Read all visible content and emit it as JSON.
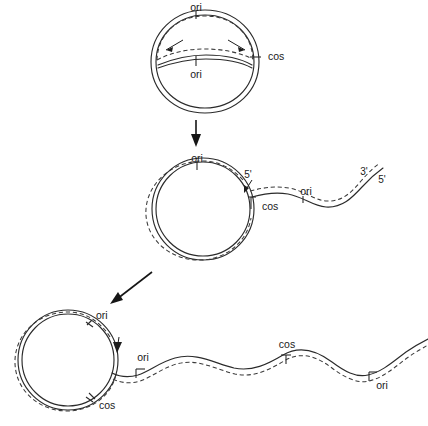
{
  "figure": {
    "background_color": "#ffffff",
    "line_color": "#2b2b2b",
    "dashed_color": "#3a3a3a"
  },
  "stages": [
    {
      "id": "stage-1",
      "name": "theta-intermediate-circle",
      "description": "Circular duplex with internal replication bubble and inward arrows",
      "labels": [
        {
          "id": "s1-ori-top",
          "text": "ori",
          "x": 196,
          "y": 8
        },
        {
          "id": "s1-ori-inner",
          "text": "ori",
          "x": 196,
          "y": 75
        },
        {
          "id": "s1-cos",
          "text": "cos",
          "x": 270,
          "y": 57
        }
      ]
    },
    {
      "id": "stage-2",
      "name": "rolling-circle-short-tail",
      "description": "Circle with displaced single tail bearing one ori and terminal 3'/5' ends",
      "labels": [
        {
          "id": "s2-ori-top",
          "text": "ori",
          "x": 197,
          "y": 159
        },
        {
          "id": "s2-five-prime",
          "text": "5'",
          "x": 248,
          "y": 175
        },
        {
          "id": "s2-cos",
          "text": "cos",
          "x": 270,
          "y": 207
        },
        {
          "id": "s2-ori-tail",
          "text": "ori",
          "x": 306,
          "y": 192
        },
        {
          "id": "s2-three-prime",
          "text": "3'",
          "x": 364,
          "y": 172
        },
        {
          "id": "s2-five-prime-end",
          "text": "5'",
          "x": 382,
          "y": 180
        }
      ]
    },
    {
      "id": "stage-3",
      "name": "rolling-circle-long-concatemer",
      "description": "Circle with long concatemeric tail carrying repeated cos and ori sites",
      "labels": [
        {
          "id": "s3-ori-circle",
          "text": "ori",
          "x": 97,
          "y": 316
        },
        {
          "id": "s3-cos-circle",
          "text": "cos",
          "x": 106,
          "y": 406
        },
        {
          "id": "s3-ori-junction",
          "text": "ori",
          "x": 143,
          "y": 358
        },
        {
          "id": "s3-cos-tail",
          "text": "cos",
          "x": 287,
          "y": 352
        },
        {
          "id": "s3-ori-tail",
          "text": "ori",
          "x": 382,
          "y": 386
        }
      ]
    }
  ],
  "arrows": [
    {
      "id": "arrow-1-2",
      "name": "stage-transition-arrow-vertical",
      "direction": "down"
    },
    {
      "id": "arrow-2-3",
      "name": "stage-transition-arrow-diagonal",
      "direction": "down-left"
    }
  ],
  "annotations": {
    "replication_direction_arrows": 2,
    "displacement_arrows": 2
  }
}
